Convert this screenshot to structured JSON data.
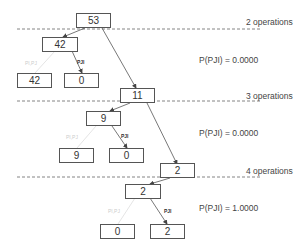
{
  "levels": [
    {
      "label": "2 operations",
      "probability": "P(PJI) = 0.0000"
    },
    {
      "label": "3 operations",
      "probability": "P(PJI) = 0.0000"
    },
    {
      "label": "4 operations",
      "probability": "P(PJI) = 1.0000"
    }
  ],
  "nodes": {
    "root": "53",
    "l1_node": "42",
    "l1_left": "42",
    "l1_right": "0",
    "l2_parent": "11",
    "l2_node": "9",
    "l2_left": "9",
    "l2_right": "0",
    "l3_parent": "2",
    "l3_node": "2",
    "l3_left": "0",
    "l3_right": "2"
  },
  "edge_labels": {
    "dark": "PJI",
    "faint": "PI,PJ"
  },
  "colors": {
    "box_border": "#555555",
    "edge": "#555555",
    "faint_edge": "#d8d8d8",
    "dashed_line": "#666666"
  }
}
